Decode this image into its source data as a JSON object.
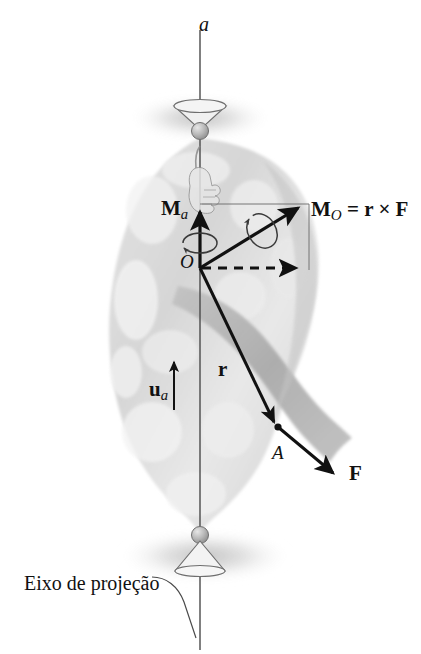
{
  "figure": {
    "kind": "mechanics-diagram",
    "language": "pt-BR",
    "background_color": "#ffffff",
    "ink_color": "#111111",
    "body_fill_color": "#dedede",
    "body_shade_color": "#b4b4b4",
    "shadow_color": "#c8c8c8"
  },
  "labels": {
    "axis_a": "a",
    "moment_axis": "M",
    "moment_axis_sub": "a",
    "moment_point_eq_lead": "M",
    "moment_point_sub": "O",
    "moment_point_eq_rest": " = r × F",
    "moment_point_full": "Mₒ = r × F",
    "origin": "O",
    "position_vector": "r",
    "unit_vector": "u",
    "unit_vector_sub": "a",
    "point_a": "A",
    "force": "F",
    "projection_axis_caption": "Eixo de projeção"
  },
  "geometry": {
    "axis_x": 200,
    "axis_top_y": 30,
    "axis_bottom_y": 648,
    "origin": {
      "x": 200,
      "y": 268
    },
    "point_A": {
      "x": 278,
      "y": 427
    },
    "force_tip": {
      "x": 338,
      "y": 478
    },
    "moment_O_tip": {
      "x": 301,
      "y": 204
    },
    "moment_a_tip": {
      "x": 200,
      "y": 205
    },
    "dashed_tip": {
      "x": 301,
      "y": 268
    },
    "unit_vector_base": {
      "x": 174,
      "y": 410
    },
    "unit_vector_tip": {
      "x": 174,
      "y": 357
    },
    "top_bearing": {
      "x": 200,
      "y": 125
    },
    "bottom_bearing": {
      "x": 200,
      "y": 540
    }
  }
}
